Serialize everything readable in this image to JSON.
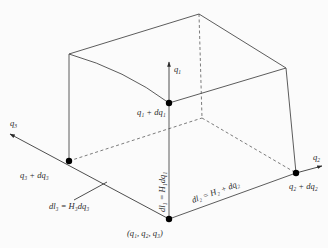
{
  "figure": {
    "axes": {
      "q1": "q",
      "q1_sub": "1",
      "q2": "q",
      "q2_sub": "2",
      "q3": "q",
      "q3_sub": "3"
    },
    "points": {
      "origin": "(q₁,  q₂,  q₃)",
      "q1_plus": "q₁ + dq₁",
      "q2_plus": "q₂ + dq₂",
      "q3_plus": "q₃ + dq₃"
    },
    "lengths": {
      "dl1": "dl₁ = H₁dq₁",
      "dl2": "dl₂ = H₂ + dq₂",
      "dl3": "dl₃ = H₃dq₃"
    }
  }
}
